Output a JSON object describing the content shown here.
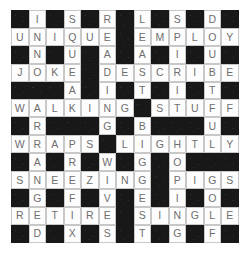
{
  "puzzle": {
    "title": "Crossword Grid",
    "rows": 13,
    "columns": 13,
    "cell_size_px": 17.5,
    "colors": {
      "block": "#181818",
      "open": "#fdfdfd",
      "letter": "#6e6e6e",
      "grid_line": "#c8c8c8",
      "page_background": "#ffffff"
    },
    "block_marker": "#",
    "grid": [
      [
        "#",
        "I",
        "#",
        "S",
        "#",
        "R",
        "#",
        "L",
        "#",
        "S",
        "#",
        "D",
        "#"
      ],
      [
        "U",
        "N",
        "I",
        "Q",
        "U",
        "E",
        "#",
        "E",
        "M",
        "P",
        "L",
        "O",
        "Y"
      ],
      [
        "#",
        "N",
        "#",
        "U",
        "#",
        "A",
        "#",
        "A",
        "#",
        "I",
        "#",
        "U",
        "#"
      ],
      [
        "J",
        "O",
        "K",
        "E",
        "#",
        "D",
        "E",
        "S",
        "C",
        "R",
        "I",
        "B",
        "E"
      ],
      [
        "#",
        "#",
        "#",
        "A",
        "#",
        "I",
        "#",
        "T",
        "#",
        "I",
        "#",
        "T",
        "#"
      ],
      [
        "W",
        "A",
        "L",
        "K",
        "I",
        "N",
        "G",
        "#",
        "S",
        "T",
        "U",
        "F",
        "F"
      ],
      [
        "#",
        "R",
        "#",
        "#",
        "#",
        "G",
        "#",
        "B",
        "#",
        "#",
        "#",
        "U",
        "#"
      ],
      [
        "W",
        "R",
        "A",
        "P",
        "S",
        "#",
        "L",
        "I",
        "G",
        "H",
        "T",
        "L",
        "Y"
      ],
      [
        "#",
        "A",
        "#",
        "R",
        "#",
        "W",
        "#",
        "G",
        "#",
        "O",
        "#",
        "#",
        "#"
      ],
      [
        "S",
        "N",
        "E",
        "E",
        "Z",
        "I",
        "N",
        "G",
        "#",
        "P",
        "I",
        "G",
        "S"
      ],
      [
        "#",
        "G",
        "#",
        "F",
        "#",
        "V",
        "#",
        "E",
        "#",
        "I",
        "#",
        "O",
        "#"
      ],
      [
        "R",
        "E",
        "T",
        "I",
        "R",
        "E",
        "#",
        "S",
        "I",
        "N",
        "G",
        "L",
        "E"
      ],
      [
        "#",
        "D",
        "#",
        "X",
        "#",
        "S",
        "#",
        "T",
        "#",
        "G",
        "#",
        "F",
        "#"
      ]
    ],
    "across_words": [
      "UNIQUE",
      "EMPLOY",
      "JOKE",
      "DESCRIBE",
      "WALKING",
      "STUFF",
      "WRAPS",
      "LIGHTLY",
      "SNEEZING",
      "PIGS",
      "RETIRE",
      "SINGLE"
    ],
    "down_words": [
      "INNOCENT",
      "SQUEAK",
      "READING",
      "LEAST",
      "SPIRITING",
      "DOUBTFUL",
      "WALRUS",
      "STUFFY",
      "WRAPS",
      "GIGGLES",
      "PIGGING"
    ]
  }
}
